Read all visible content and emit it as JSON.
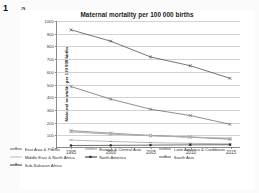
{
  "figure": {
    "number": "1",
    "panel": "a"
  },
  "chart_data": {
    "type": "line",
    "title": "Maternal mortality per 100 000 births",
    "xlabel": "",
    "ylabel": "Maternal mortality per 100 000 births",
    "x": [
      1995,
      2000,
      2005,
      2010,
      2015
    ],
    "xtick_labels": [
      "1995",
      "2000",
      "2005",
      "2010",
      "2015"
    ],
    "ytick_labels": [
      "0",
      "100",
      "200",
      "300",
      "400",
      "500",
      "600",
      "700",
      "800",
      "900",
      "1000"
    ],
    "ylim": [
      0,
      1000
    ],
    "ystep": 100,
    "grid": true,
    "legend_position": "bottom",
    "series": [
      {
        "name": "East Asia & Pacific",
        "color": "#6e6e6e",
        "marker": "cross",
        "values": [
          130,
          110,
          92,
          78,
          62
        ]
      },
      {
        "name": "Europe & Central Asia",
        "color": "#9a9a9a",
        "marker": "dash",
        "values": [
          55,
          44,
          35,
          29,
          25
        ]
      },
      {
        "name": "Latin America & Caribbean",
        "color": "#7d7d7d",
        "marker": "cross",
        "values": [
          120,
          103,
          89,
          79,
          68
        ]
      },
      {
        "name": "Middle East & North Africa",
        "color": "#c0c0c0",
        "marker": "dash",
        "values": [
          123,
          105,
          90,
          78,
          70
        ]
      },
      {
        "name": "North America",
        "color": "#2b2b2b",
        "marker": "square",
        "values": [
          12,
          13,
          15,
          17,
          18
        ]
      },
      {
        "name": "South Asia",
        "color": "#5c5c5c",
        "marker": "cross",
        "values": [
          480,
          380,
          300,
          250,
          180
        ]
      },
      {
        "name": "Sub-Saharan Africa",
        "color": "#3a3a3a",
        "marker": "cross",
        "values": [
          930,
          840,
          715,
          645,
          545
        ]
      }
    ]
  }
}
